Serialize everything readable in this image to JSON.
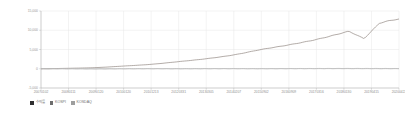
{
  "chart_data": {
    "type": "line",
    "title": "",
    "subtitle": "",
    "xlabel": "",
    "ylabel": "",
    "grid": true,
    "legend_position": "bottom-left",
    "ylim": [
      -5000,
      15000
    ],
    "yticks": [
      15000,
      10000,
      5000,
      0,
      -5000
    ],
    "ytick_labels": [
      "15,000",
      "10,000",
      "5,000",
      "0",
      "-5,000"
    ],
    "x": [
      "20070102",
      "20080111",
      "20090120",
      "20100120",
      "20101213",
      "20120331",
      "20130305",
      "20140207",
      "20150902",
      "20160909",
      "20170316",
      "20180130",
      "20190415",
      "20200422"
    ],
    "xtick_labels": [
      "20070102",
      "20080111",
      "20090120",
      "20100120",
      "20101213",
      "20120331",
      "20130305",
      "20140207",
      "20150902",
      "20160909",
      "20170316",
      "20180130",
      "20190415",
      "20200422"
    ],
    "series": [
      {
        "name": "수익률",
        "color": "#8a7f78",
        "values": [
          0,
          120,
          300,
          700,
          1150,
          1850,
          2600,
          3600,
          5000,
          6200,
          7600,
          9400,
          11300,
          12900
        ]
      },
      {
        "name": "KOSPI",
        "color": "#a9a9a9",
        "values": [
          0,
          5,
          -20,
          10,
          25,
          20,
          35,
          40,
          30,
          45,
          60,
          70,
          65,
          55
        ]
      },
      {
        "name": "KOSDAQ",
        "color": "#c2c2c2",
        "values": [
          0,
          -10,
          -40,
          -15,
          5,
          -5,
          10,
          15,
          5,
          20,
          30,
          35,
          25,
          15
        ]
      }
    ]
  },
  "legend": {
    "items": [
      {
        "label": "수익률",
        "color": "#2f2f2f"
      },
      {
        "label": "KOSPI",
        "color": "#6d6d6d"
      },
      {
        "label": "KOSDAQ",
        "color": "#9e9e9e"
      }
    ]
  }
}
